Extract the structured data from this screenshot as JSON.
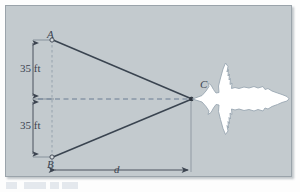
{
  "figure": {
    "type": "geometry-diagram",
    "background_color": "#c3cace",
    "line_color": "#3c4450",
    "dash_color": "#6b7d93",
    "plane_fill": "#ffffff",
    "plane_stroke": "#9aa7b2",
    "labels": {
      "point_a": "A",
      "point_b": "B",
      "point_c": "C",
      "distance_d": "d",
      "upper_dimension": "35 ft",
      "lower_dimension": "35 ft"
    },
    "geometry": {
      "point_a": {
        "x": 46,
        "y": 34
      },
      "point_b": {
        "x": 46,
        "y": 151
      },
      "point_c": {
        "x": 185,
        "y": 93
      },
      "dimension_line_x": 27,
      "baseline_y": 164,
      "axis_y": 93
    }
  }
}
